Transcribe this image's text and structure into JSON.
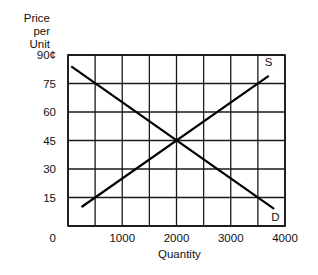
{
  "chart_data": {
    "type": "line",
    "title": "",
    "xlabel": "Quantity",
    "ylabel": [
      "Price per",
      "Unit"
    ],
    "xlim": [
      0,
      4000
    ],
    "ylim": [
      0,
      90
    ],
    "x_ticks": [
      {
        "value": 0,
        "label": "0"
      },
      {
        "value": 1000,
        "label": "1000"
      },
      {
        "value": 2000,
        "label": "2000"
      },
      {
        "value": 3000,
        "label": "3000"
      },
      {
        "value": 4000,
        "label": "4000"
      }
    ],
    "y_ticks": [
      {
        "value": 15,
        "label": "15"
      },
      {
        "value": 30,
        "label": "30"
      },
      {
        "value": 45,
        "label": "45"
      },
      {
        "value": 60,
        "label": "60"
      },
      {
        "value": 75,
        "label": "75"
      },
      {
        "value": 90,
        "label": "90¢"
      }
    ],
    "origin_label": "0",
    "grid": {
      "x_step": 500,
      "y_step": 15,
      "on": true
    },
    "series": [
      {
        "name": "S",
        "label": "S",
        "x": [
          250,
          3700
        ],
        "y": [
          10,
          79
        ]
      },
      {
        "name": "D",
        "label": "D",
        "x": [
          60,
          3800
        ],
        "y": [
          84,
          9
        ]
      }
    ],
    "equilibrium": {
      "x": 2000,
      "y": 45
    },
    "legend": "inline labels at line ends"
  }
}
